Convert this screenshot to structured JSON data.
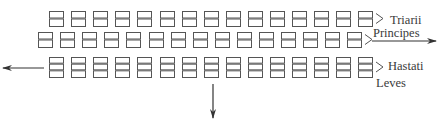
{
  "diagram": {
    "rows": [
      {
        "id": "triarii",
        "label": "Triarii",
        "count": 15,
        "x0": 49,
        "y": 11,
        "pitch": 22.1,
        "w": 14,
        "h": 15,
        "compartments": 2
      },
      {
        "id": "principes",
        "label": "Principes",
        "count": 15,
        "x0": 38,
        "y": 32,
        "pitch": 22.1,
        "w": 14,
        "h": 15,
        "compartments": 2
      },
      {
        "id": "hastati",
        "label": "Hastati",
        "count": 15,
        "x0": 49,
        "y": 57,
        "pitch": 22.1,
        "w": 14,
        "h": 20,
        "compartments": 3
      }
    ],
    "extra_labels": {
      "leves": "Leves"
    },
    "arrows": {
      "right": {
        "x1": 372,
        "y1": 41,
        "x2": 436,
        "y2": 41
      },
      "left": {
        "x1": 44,
        "y1": 68,
        "x2": 3,
        "y2": 68
      },
      "down": {
        "x1": 213,
        "y1": 84,
        "x2": 213,
        "y2": 118
      }
    },
    "colors": {
      "box_stroke": "#555555",
      "text": "#3a3a3a",
      "arrow": "#333333"
    }
  }
}
